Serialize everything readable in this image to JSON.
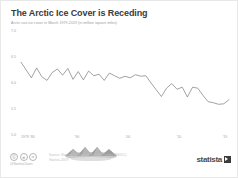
{
  "header": {
    "title": "The Arctic Ice Cover is Receding",
    "subtitle": "Arctic sea ice cover in March 1979-2019 (in million square miles)"
  },
  "footer": {
    "cc_icons": [
      "cc-icon",
      "by-icon",
      "nd-icon"
    ],
    "handle": "@StatistaCharts",
    "source_line1": "Source: National Snow and Ice Data Center (NSIDC)",
    "source_line2": "Statista 2019",
    "brand": "statista",
    "brand_mark": "play-mark-icon"
  },
  "chart_data": {
    "type": "line",
    "title": "The Arctic Ice Cover is Receding",
    "subtitle": "Arctic sea ice cover in March 1979-2019 (in million square miles)",
    "xlabel": "",
    "ylabel": "",
    "ylim": [
      5.0,
      7.0
    ],
    "ytick_labels": [
      "7.0",
      "6.5",
      "6.0",
      "5.5",
      "5.0"
    ],
    "ytick_values": [
      7.0,
      6.5,
      6.0,
      5.5,
      5.0
    ],
    "xtick_labels": [
      "1979 '80",
      "'90",
      "'00",
      "'10",
      "'19"
    ],
    "xtick_values": [
      1979,
      1990,
      2000,
      2010,
      2019
    ],
    "grid": false,
    "legend": "none",
    "line_color": "#8a8a8a",
    "x": [
      1979,
      1980,
      1981,
      1982,
      1983,
      1984,
      1985,
      1986,
      1987,
      1988,
      1989,
      1990,
      1991,
      1992,
      1993,
      1994,
      1995,
      1996,
      1997,
      1998,
      1999,
      2000,
      2001,
      2002,
      2003,
      2004,
      2005,
      2006,
      2007,
      2008,
      2009,
      2010,
      2011,
      2012,
      2013,
      2014,
      2015,
      2016,
      2017,
      2018,
      2019
    ],
    "values": [
      6.4,
      6.25,
      6.1,
      6.29,
      6.12,
      6.05,
      6.2,
      6.27,
      6.15,
      6.28,
      6.07,
      6.22,
      6.06,
      6.23,
      6.14,
      6.17,
      6.05,
      6.19,
      6.14,
      6.09,
      6.13,
      6.1,
      6.16,
      6.13,
      6.14,
      6.0,
      5.87,
      5.74,
      5.9,
      5.99,
      5.88,
      5.92,
      5.73,
      5.92,
      5.9,
      5.76,
      5.64,
      5.62,
      5.59,
      5.6,
      5.68
    ],
    "annotation_image": "iceberg-illustration"
  }
}
